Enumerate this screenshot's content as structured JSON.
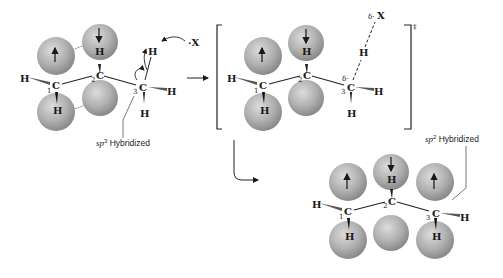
{
  "figure": {
    "type": "radical allylic bromination mechanism diagram",
    "colors": {
      "orbital_light": "#d0d0d0",
      "orbital_dark": "#8a8a8a",
      "line": "#1a1a1a"
    }
  },
  "reactant": {
    "atoms": {
      "H": "H",
      "C": "C",
      "X": "·X"
    },
    "numbers": [
      "1",
      "2",
      "3"
    ],
    "annotation": {
      "sp": "sp",
      "sup": "3",
      "rest": " Hybridized"
    }
  },
  "transition_state": {
    "atoms": {
      "H": "H",
      "C": "C",
      "X": "X"
    },
    "numbers": [
      "1",
      "2",
      "3"
    ],
    "delta": "δ·",
    "delta_c": "δ·",
    "double_dagger": "‡"
  },
  "product": {
    "atoms": {
      "H": "H",
      "C": "C"
    },
    "numbers": [
      "1",
      "2",
      "3"
    ],
    "annotation": {
      "sp": "sp",
      "sup": "2",
      "rest": " Hybridized"
    }
  }
}
